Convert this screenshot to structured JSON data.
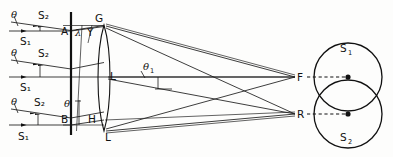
{
  "figure": {
    "background_color": "#fdfdfc",
    "ink_color": "#111111"
  },
  "labels": {
    "theta": "θ",
    "theta_1_base": "θ",
    "theta_1_sub": "1",
    "lambda": "λ",
    "gamma": "Y",
    "source_1_base": "S",
    "source_1_sub": "1",
    "source_2_base": "S",
    "source_2_sub": "2",
    "point_A": "A",
    "point_B": "B",
    "point_G": "G",
    "point_H": "H",
    "point_L": "L",
    "point_L2": "L",
    "point_L3": "L",
    "focus_F": "F",
    "focus_R": "R",
    "circle_top_base": "S",
    "circle_top_sub": "1",
    "circle_bottom_base": "S",
    "circle_bottom_sub": "2"
  },
  "ray_groups": [
    {
      "name": "top-ray-group",
      "theta_label": "θ",
      "s2_label": "S₂",
      "s1_label": "S₁",
      "y_upper": 22,
      "y_lower": 31
    },
    {
      "name": "middle-ray-group",
      "theta_label": "θ",
      "s2_label": "S₂",
      "s1_label": "S₁",
      "y_upper": 60,
      "y_lower": 77
    },
    {
      "name": "bottom-ray-group",
      "theta_label": "θ",
      "s2_label": "S₂",
      "s1_label": "S₁",
      "y_upper": 109,
      "y_lower": 125
    }
  ],
  "geometry": {
    "barrier_x": 71,
    "lens_center_x": 104,
    "lens_top_y": 25,
    "lens_bottom_y": 131,
    "focus_F": {
      "x": 295,
      "y": 77
    },
    "focus_R": {
      "x": 295,
      "y": 114
    },
    "circle_S1": {
      "cx": 348,
      "cy": 77,
      "r": 34
    },
    "circle_S2": {
      "cx": 348,
      "cy": 114,
      "r": 34
    },
    "optical_axis_y": 77
  }
}
